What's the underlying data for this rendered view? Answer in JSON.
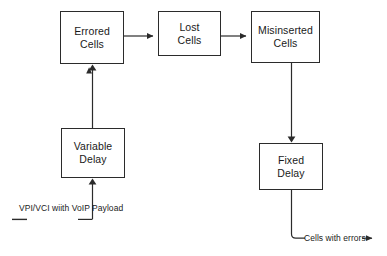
{
  "diagram": {
    "stroke_color": "#2b2b2b",
    "text_color": "#1a1a1a",
    "background_color": "#ffffff",
    "nodes": [
      {
        "id": "errored-cells",
        "line1": "Errored",
        "line2": "Cells",
        "x": 60,
        "y": 11,
        "w": 64,
        "h": 53
      },
      {
        "id": "lost-cells",
        "line1": "Lost",
        "line2": "Cells",
        "x": 158,
        "y": 11,
        "w": 63,
        "h": 45
      },
      {
        "id": "misinserted-cells",
        "line1": "Misinserted",
        "line2": "Cells",
        "x": 251,
        "y": 11,
        "w": 69,
        "h": 52
      },
      {
        "id": "variable-delay",
        "line1": "Variable",
        "line2": "Delay",
        "x": 61,
        "y": 128,
        "w": 64,
        "h": 50
      },
      {
        "id": "fixed-delay",
        "line1": "Fixed",
        "line2": "Delay",
        "x": 259,
        "y": 143,
        "w": 64,
        "h": 47
      }
    ],
    "labels": {
      "input": {
        "line1": "VPI/VCI",
        "line2": "wiith",
        "line3": "VoIP Payload"
      },
      "output": "Cells with errors"
    },
    "connectors": [
      {
        "id": "errored-to-lost",
        "from": "errored-cells",
        "to": "lost-cells",
        "kind": "arrow-right"
      },
      {
        "id": "lost-to-misinserted",
        "from": "lost-cells",
        "to": "misinserted-cells",
        "kind": "arrow-right"
      },
      {
        "id": "variable-delay-to-errored",
        "from": "variable-delay",
        "to": "errored-cells",
        "kind": "arrow-up"
      },
      {
        "id": "input-to-variable-delay",
        "from": "input",
        "to": "variable-delay",
        "kind": "arrow-up-elbow"
      },
      {
        "id": "misinserted-to-fixed-delay",
        "from": "misinserted-cells",
        "to": "fixed-delay",
        "kind": "arrow-down"
      },
      {
        "id": "fixed-delay-to-output",
        "from": "fixed-delay",
        "to": "output",
        "kind": "elbow-arrow-right"
      }
    ]
  }
}
